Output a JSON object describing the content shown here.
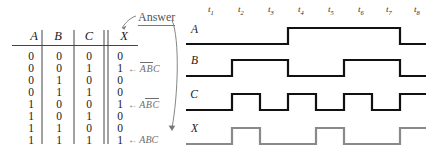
{
  "truth_table": {
    "headers": [
      "A",
      "B",
      "C",
      "X"
    ],
    "rows": [
      {
        "a": "0",
        "b": "0",
        "c": "0",
        "x": "0",
        "note": null
      },
      {
        "a": "0",
        "b": "0",
        "c": "1",
        "x": "1",
        "note": {
          "arrow": "←",
          "terms": [
            {
              "t": "A",
              "bar": true
            },
            {
              "t": "B",
              "bar": true
            },
            {
              "t": "C",
              "bar": false
            }
          ]
        }
      },
      {
        "a": "0",
        "b": "1",
        "c": "0",
        "x": "0",
        "note": null
      },
      {
        "a": "0",
        "b": "1",
        "c": "1",
        "x": "0",
        "note": null
      },
      {
        "a": "1",
        "b": "0",
        "c": "0",
        "x": "1",
        "note": {
          "arrow": "←",
          "terms": [
            {
              "t": "A",
              "bar": false
            },
            {
              "t": "B",
              "bar": true
            },
            {
              "t": "C",
              "bar": true
            }
          ]
        }
      },
      {
        "a": "1",
        "b": "0",
        "c": "1",
        "x": "0",
        "note": null
      },
      {
        "a": "1",
        "b": "1",
        "c": "0",
        "x": "0",
        "note": null
      },
      {
        "a": "1",
        "b": "1",
        "c": "1",
        "x": "1",
        "note": {
          "arrow": "←",
          "terms": [
            {
              "t": "A",
              "bar": false
            },
            {
              "t": "B",
              "bar": false
            },
            {
              "t": "C",
              "bar": false
            }
          ]
        }
      }
    ]
  },
  "annotation": {
    "answer_label": "Answer"
  },
  "timing": {
    "tick_labels": [
      "t",
      "t",
      "t",
      "t",
      "t",
      "t",
      "t",
      "t"
    ],
    "tick_subs": [
      "1",
      "2",
      "3",
      "4",
      "5",
      "6",
      "7",
      "8"
    ],
    "signals": [
      {
        "name": "A",
        "color": "#111111",
        "levels": [
          0,
          0,
          0,
          1,
          1,
          1,
          1,
          0
        ]
      },
      {
        "name": "B",
        "color": "#111111",
        "levels": [
          0,
          1,
          1,
          0,
          0,
          1,
          1,
          0
        ]
      },
      {
        "name": "C",
        "color": "#111111",
        "levels": [
          0,
          1,
          0,
          1,
          0,
          1,
          0,
          1
        ]
      },
      {
        "name": "X",
        "color": "#8a8a8a",
        "levels": [
          0,
          1,
          0,
          0,
          1,
          0,
          0,
          1
        ]
      }
    ]
  },
  "colors": {
    "ink": "#111111",
    "gray_signal": "#8a8a8a",
    "note_gray": "#6e6e6e",
    "rule": "#444444"
  }
}
